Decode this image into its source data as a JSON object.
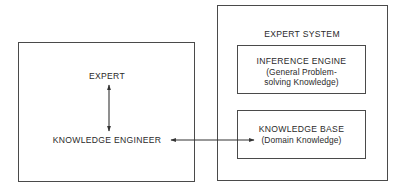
{
  "diagram": {
    "left_panel": {
      "expert_label": "EXPERT",
      "engineer_label": "KNOWLEDGE ENGINEER"
    },
    "expert_system": {
      "title": "EXPERT SYSTEM",
      "inference_engine": {
        "title": "INFERENCE ENGINE",
        "subtitle_line1": "(General Problem-",
        "subtitle_line2": "solving Knowledge)"
      },
      "knowledge_base": {
        "title": "KNOWLEDGE BASE",
        "subtitle": "(Domain Knowledge)"
      }
    },
    "connections": [
      {
        "from": "EXPERT",
        "to": "KNOWLEDGE ENGINEER",
        "type": "bidirectional"
      },
      {
        "from": "KNOWLEDGE ENGINEER",
        "to": "KNOWLEDGE BASE",
        "type": "bidirectional"
      }
    ],
    "colors": {
      "line": "#4a4a4a",
      "text": "#2a2a2a",
      "background": "#ffffff"
    }
  }
}
